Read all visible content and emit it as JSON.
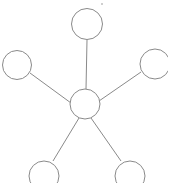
{
  "diagram": {
    "type": "node-link-graph",
    "topology": "star",
    "background_color": "#ffffff",
    "stroke_color": "#8a8a8a",
    "node_fill_color": "#ffffff",
    "stroke_width": 1,
    "canvas": {
      "width": 168,
      "height": 183
    },
    "node_count": 6,
    "edge_count": 5,
    "nodes": [
      {
        "id": "center",
        "label": "",
        "cx": 85,
        "cy": 104,
        "r": 15,
        "role": "hub",
        "clipped": false
      },
      {
        "id": "top",
        "label": "",
        "cx": 87,
        "cy": 24,
        "r": 15.5,
        "role": "leaf",
        "clipped": false
      },
      {
        "id": "left",
        "label": "",
        "cx": 17,
        "cy": 65,
        "r": 14.5,
        "role": "leaf",
        "clipped": false
      },
      {
        "id": "right",
        "label": "",
        "cx": 155,
        "cy": 64,
        "r": 15,
        "role": "leaf",
        "clipped": true
      },
      {
        "id": "bottom-left",
        "label": "",
        "cx": 44,
        "cy": 176,
        "r": 15,
        "role": "leaf",
        "clipped": true
      },
      {
        "id": "bottom-right",
        "label": "",
        "cx": 130,
        "cy": 176,
        "r": 15,
        "role": "leaf",
        "clipped": true
      }
    ],
    "edges": [
      {
        "id": "edge-center-top",
        "from": "center",
        "to": "top",
        "x1": 86,
        "y1": 89,
        "x2": 87,
        "y2": 40
      },
      {
        "id": "edge-center-left",
        "from": "center",
        "to": "left",
        "x1": 71,
        "y1": 103,
        "x2": 30,
        "y2": 73
      },
      {
        "id": "edge-center-right",
        "from": "center",
        "to": "right",
        "x1": 99,
        "y1": 101,
        "x2": 141,
        "y2": 72
      },
      {
        "id": "edge-center-bottom-left",
        "from": "center",
        "to": "bottom-left",
        "x1": 79,
        "y1": 118,
        "x2": 53,
        "y2": 161
      },
      {
        "id": "edge-center-bottom-right",
        "from": "center",
        "to": "bottom-right",
        "x1": 91,
        "y1": 118,
        "x2": 121,
        "y2": 161
      }
    ],
    "artifacts": [
      {
        "id": "speck-top",
        "x": 101,
        "y": 3,
        "w": 2,
        "h": 2
      }
    ]
  }
}
